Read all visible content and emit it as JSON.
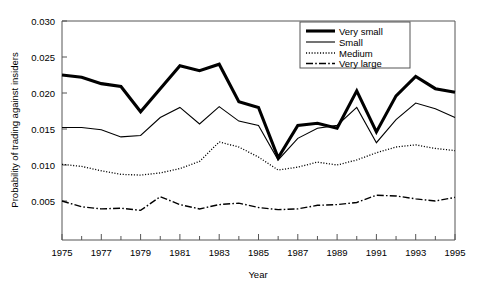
{
  "chart_data": {
    "type": "line",
    "title": "",
    "xlabel": "Year",
    "ylabel": "Probability of trading against insiders",
    "xlim": [
      1975,
      1995
    ],
    "ylim": [
      0.0,
      0.03
    ],
    "grid": false,
    "legend_position": "top-right",
    "x": [
      1975,
      1976,
      1977,
      1978,
      1979,
      1980,
      1981,
      1982,
      1983,
      1984,
      1985,
      1986,
      1987,
      1988,
      1989,
      1990,
      1991,
      1992,
      1993,
      1994,
      1995
    ],
    "xticks": [
      "1975",
      "1977",
      "1979",
      "1981",
      "1983",
      "1985",
      "1987",
      "1989",
      "1991",
      "1993",
      "1995"
    ],
    "yticks": [
      "0.030",
      "0.025",
      "0.020",
      "0.015",
      "0.010",
      "0.005"
    ],
    "ytick_values": [
      0.03,
      0.025,
      0.02,
      0.015,
      0.01,
      0.005
    ],
    "series": [
      {
        "name": "Very small",
        "style": "thick-solid",
        "values": [
          0.0225,
          0.0222,
          0.0213,
          0.0209,
          0.0174,
          0.0206,
          0.0238,
          0.0231,
          0.024,
          0.0188,
          0.018,
          0.011,
          0.0155,
          0.0158,
          0.0151,
          0.0203,
          0.0146,
          0.0196,
          0.0223,
          0.0206,
          0.0201
        ]
      },
      {
        "name": "Small",
        "style": "thin-solid",
        "values": [
          0.0152,
          0.0152,
          0.0149,
          0.0139,
          0.0141,
          0.0166,
          0.018,
          0.0157,
          0.0181,
          0.0161,
          0.0155,
          0.0107,
          0.0137,
          0.0151,
          0.0155,
          0.018,
          0.0131,
          0.0163,
          0.0186,
          0.0178,
          0.0166
        ]
      },
      {
        "name": "Medium",
        "style": "dotted",
        "values": [
          0.0101,
          0.0098,
          0.0092,
          0.0087,
          0.0086,
          0.0089,
          0.0095,
          0.0105,
          0.0132,
          0.0125,
          0.0111,
          0.0093,
          0.0097,
          0.0104,
          0.01,
          0.0107,
          0.0117,
          0.0125,
          0.0128,
          0.0123,
          0.012
        ]
      },
      {
        "name": "Very large",
        "style": "dash-dot",
        "values": [
          0.005,
          0.0042,
          0.0039,
          0.004,
          0.0037,
          0.0056,
          0.0045,
          0.0039,
          0.0045,
          0.0047,
          0.0041,
          0.0038,
          0.0039,
          0.0044,
          0.0045,
          0.0048,
          0.0058,
          0.0057,
          0.0053,
          0.005,
          0.0055
        ]
      }
    ]
  },
  "legend": {
    "items": [
      {
        "label": "Very small"
      },
      {
        "label": "Small"
      },
      {
        "label": "Medium"
      },
      {
        "label": "Very large"
      }
    ]
  }
}
